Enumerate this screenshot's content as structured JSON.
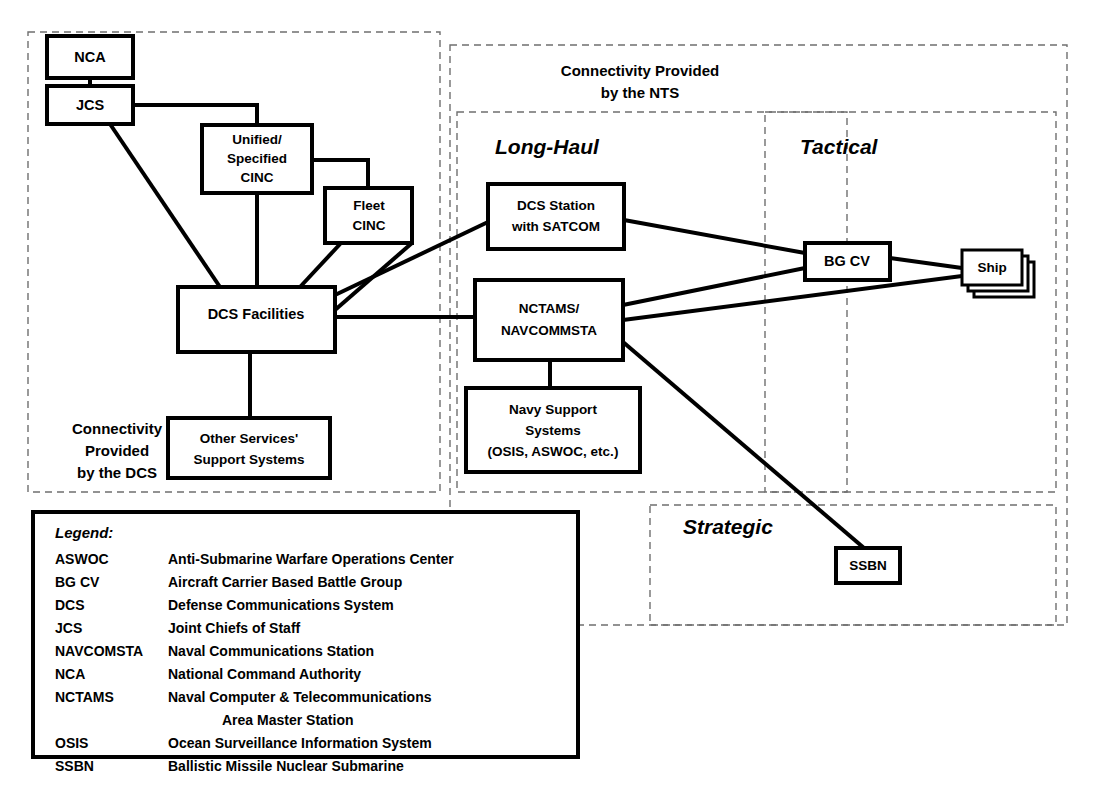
{
  "diagram": {
    "colors": {
      "box_stroke": "#000000",
      "region_stroke": "#6f6f6f",
      "background": "#ffffff",
      "text": "#000000"
    },
    "regions": [
      {
        "id": "dcs-region",
        "caption_line1": "Connectivity",
        "caption_line2": "Provided",
        "caption_line3": "by the DCS"
      },
      {
        "id": "nts-region",
        "caption_line1": "Connectivity Provided",
        "caption_line2": "by the NTS"
      },
      {
        "id": "long-haul-region",
        "title": "Long-Haul"
      },
      {
        "id": "tactical-region",
        "title": "Tactical"
      },
      {
        "id": "strategic-region",
        "title": "Strategic"
      }
    ],
    "nodes": [
      {
        "id": "nca",
        "lines": [
          "NCA"
        ]
      },
      {
        "id": "jcs",
        "lines": [
          "JCS"
        ]
      },
      {
        "id": "unified-specified-cinc",
        "lines": [
          "Unified/",
          "Specified",
          "CINC"
        ]
      },
      {
        "id": "fleet-cinc",
        "lines": [
          "Fleet",
          "CINC"
        ]
      },
      {
        "id": "dcs-facilities",
        "lines": [
          "DCS Facilities"
        ]
      },
      {
        "id": "other-services-support-systems",
        "lines": [
          "Other Services'",
          "Support Systems"
        ]
      },
      {
        "id": "dcs-station-satcom",
        "lines": [
          "DCS Station",
          "with SATCOM"
        ]
      },
      {
        "id": "nctams-navcommsta",
        "lines": [
          "NCTAMS/",
          "NAVCOMMSTA"
        ]
      },
      {
        "id": "navy-support-systems",
        "lines": [
          "Navy Support",
          "Systems",
          "(OSIS, ASWOC, etc.)"
        ]
      },
      {
        "id": "bg-cv",
        "lines": [
          "BG CV"
        ]
      },
      {
        "id": "ship",
        "lines": [
          "Ship"
        ]
      },
      {
        "id": "ssbn",
        "lines": [
          "SSBN"
        ]
      }
    ]
  },
  "legend": {
    "title": "Legend:",
    "entries": [
      {
        "abbr": "ASWOC",
        "desc": "Anti-Submarine Warfare Operations Center"
      },
      {
        "abbr": "BG CV",
        "desc": "Aircraft Carrier Based Battle Group"
      },
      {
        "abbr": "DCS",
        "desc": "Defense Communications System"
      },
      {
        "abbr": "JCS",
        "desc": "Joint Chiefs of Staff"
      },
      {
        "abbr": "NAVCOMSTA",
        "desc": "Naval Communications Station"
      },
      {
        "abbr": "NCA",
        "desc": "National Command Authority"
      },
      {
        "abbr": "NCTAMS",
        "desc": "Naval Computer & Telecommunications",
        "desc2": "Area Master Station"
      },
      {
        "abbr": "OSIS",
        "desc": "Ocean Surveillance Information System"
      },
      {
        "abbr": "SSBN",
        "desc": "Ballistic Missile Nuclear Submarine"
      }
    ]
  }
}
